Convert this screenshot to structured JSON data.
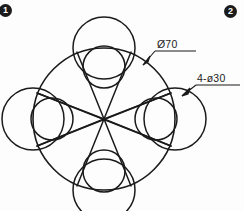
{
  "figure": {
    "kind": "engineering-drawing",
    "background": "#fdfdfd",
    "line_color": "#1b1b1b",
    "markers": [
      {
        "name": "callout-1",
        "label": "1"
      },
      {
        "name": "callout-2",
        "label": "2"
      }
    ],
    "dimensions": [
      {
        "name": "bolt-circle-diameter",
        "label": "Ø70",
        "leader_from": [
          155,
          52
        ],
        "leader_to": [
          144,
          64
        ],
        "symbol": "diameter",
        "value": 70
      },
      {
        "name": "hole-pattern",
        "label": "4-ø30",
        "leader_from": [
          195,
          86
        ],
        "leader_to": [
          181,
          96
        ],
        "symbol": "diameter",
        "value": 30,
        "count": 4
      }
    ],
    "geometry": {
      "center": [
        104,
        119
      ],
      "main_circle_radius": 71,
      "satellite_count": 4,
      "satellite_radius": 31,
      "satellite_center_radius": 71,
      "satellite_angles_deg": [
        270,
        0,
        90,
        180
      ],
      "inner_circle_radius": 21,
      "inner_center_radius": 52,
      "star_line_count": 6,
      "stroke_width": 1.5
    }
  }
}
